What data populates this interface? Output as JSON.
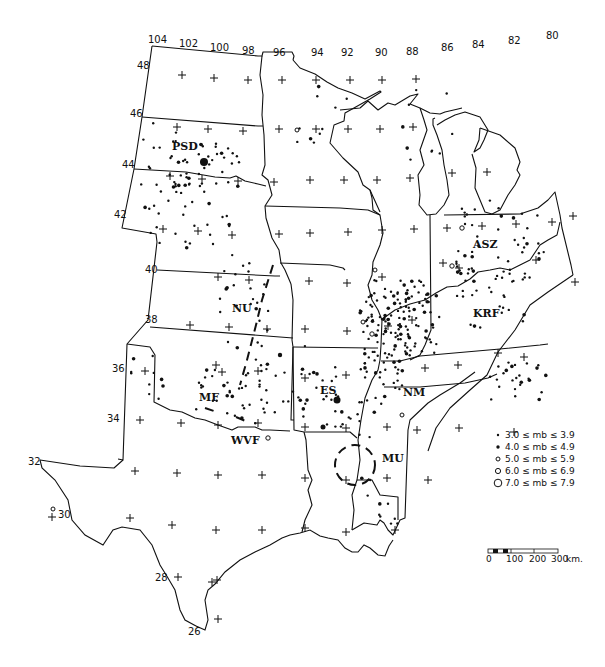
{
  "map": {
    "title": "Seismicity of the central and eastern United States",
    "longitude_labels": [
      {
        "value": "104",
        "x": 150,
        "y": 43
      },
      {
        "value": "102",
        "x": 181,
        "y": 47
      },
      {
        "value": "100",
        "x": 212,
        "y": 51
      },
      {
        "value": "98",
        "x": 242,
        "y": 54
      },
      {
        "value": "96",
        "x": 273,
        "y": 56
      },
      {
        "value": "94",
        "x": 311,
        "y": 56
      },
      {
        "value": "92",
        "x": 341,
        "y": 56
      },
      {
        "value": "90",
        "x": 375,
        "y": 56
      },
      {
        "value": "88",
        "x": 406,
        "y": 55
      },
      {
        "value": "86",
        "x": 441,
        "y": 51
      },
      {
        "value": "84",
        "x": 472,
        "y": 48
      },
      {
        "value": "82",
        "x": 508,
        "y": 44
      },
      {
        "value": "80",
        "x": 546,
        "y": 39
      }
    ],
    "latitude_labels": [
      {
        "value": "48",
        "x": 137,
        "y": 69
      },
      {
        "value": "46",
        "x": 130,
        "y": 117
      },
      {
        "value": "44",
        "x": 122,
        "y": 168
      },
      {
        "value": "42",
        "x": 114,
        "y": 218
      },
      {
        "value": "40",
        "x": 145,
        "y": 273
      },
      {
        "value": "38",
        "x": 145,
        "y": 323
      },
      {
        "value": "36",
        "x": 112,
        "y": 372
      },
      {
        "value": "34",
        "x": 107,
        "y": 422
      },
      {
        "value": "32",
        "x": 28,
        "y": 465
      },
      {
        "value": "30",
        "x": 58,
        "y": 518
      },
      {
        "value": "28",
        "x": 155,
        "y": 581
      },
      {
        "value": "26",
        "x": 188,
        "y": 635
      }
    ],
    "region_labels": [
      {
        "code": "PSD",
        "x": 172,
        "y": 150
      },
      {
        "code": "NU",
        "x": 232,
        "y": 312
      },
      {
        "code": "MF",
        "x": 199,
        "y": 401
      },
      {
        "code": "WVF",
        "x": 231,
        "y": 444
      },
      {
        "code": "ES",
        "x": 320,
        "y": 394
      },
      {
        "code": "NM",
        "x": 403,
        "y": 396
      },
      {
        "code": "MU",
        "x": 382,
        "y": 462
      },
      {
        "code": "ASZ",
        "x": 473,
        "y": 248
      },
      {
        "code": "KRF",
        "x": 473,
        "y": 317
      }
    ]
  },
  "legend": {
    "items": [
      {
        "symbol": "dot-small",
        "label": "3.0 ≤ mb ≤ 3.9",
        "text": "30 ≤ m",
        "sub": "b",
        "tail": " ≤ 39"
      },
      {
        "symbol": "dot-medium",
        "label": "4.0 ≤ mb ≤ 4.9",
        "text": "40 ≤ m",
        "sub": "b",
        "tail": " ≤ 49"
      },
      {
        "symbol": "circle-small",
        "label": "5.0 ≤ mb ≤ 5.9",
        "text": "50 ≤ m",
        "sub": "b",
        "tail": " ≤ 59"
      },
      {
        "symbol": "circle-medium",
        "label": "6.0 ≤ mb ≤ 6.9",
        "text": "60 ≤ m",
        "sub": "b",
        "tail": " ≤ 69"
      },
      {
        "symbol": "circle-large",
        "label": "7.0 ≤ mb ≤ 7.9",
        "text": "7.0 ≤ m",
        "sub": "b",
        "tail": " ≤ 7.9"
      }
    ]
  },
  "scale_bar": {
    "ticks": [
      "0",
      "100",
      "200",
      "300"
    ],
    "unit": "km."
  }
}
